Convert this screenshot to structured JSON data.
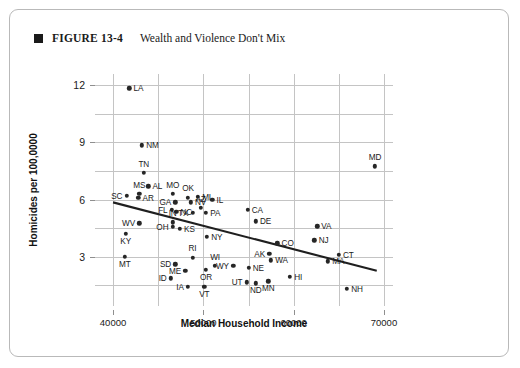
{
  "caption": {
    "marker": "square-bullet",
    "figure_number": "FIGURE 13-4",
    "title": "Wealth and Violence Don't Mix"
  },
  "chart_data": {
    "type": "scatter",
    "title": "Wealth and Violence Don't Mix",
    "xlabel": "Median Household Income",
    "ylabel": "Homicides per 100,0000",
    "xlim": [
      38000,
      71000
    ],
    "ylim": [
      0.4,
      12.6
    ],
    "xticks": [
      40000,
      50000,
      60000,
      70000
    ],
    "xticklabels": [
      "40000",
      "50000",
      "60000",
      "70000"
    ],
    "yticks": [
      3,
      6,
      9,
      12
    ],
    "yticklabels": [
      "3",
      "6",
      "9",
      "12"
    ],
    "grid": true,
    "legend": null,
    "trendline": {
      "type": "linear-fit",
      "x_start": 40000,
      "y_start": 5.85,
      "x_end": 69200,
      "y_end": 2.25
    },
    "point_label_field": "state",
    "points": [
      {
        "state": "LA",
        "x": 41800,
        "y": 11.85,
        "pos": "r"
      },
      {
        "state": "NM",
        "x": 43200,
        "y": 8.85,
        "pos": "r"
      },
      {
        "state": "MD",
        "x": 69000,
        "y": 7.75,
        "pos": "t"
      },
      {
        "state": "TN",
        "x": 43400,
        "y": 7.4,
        "pos": "t"
      },
      {
        "state": "AL",
        "x": 43900,
        "y": 6.7,
        "pos": "r"
      },
      {
        "state": "MS",
        "x": 42900,
        "y": 6.3,
        "pos": "t"
      },
      {
        "state": "SC",
        "x": 41500,
        "y": 6.2,
        "pos": "l"
      },
      {
        "state": "AR",
        "x": 42800,
        "y": 6.1,
        "pos": "r"
      },
      {
        "state": "MO",
        "x": 46600,
        "y": 6.3,
        "pos": "t"
      },
      {
        "state": "OK",
        "x": 48300,
        "y": 6.1,
        "pos": "t"
      },
      {
        "state": "MI",
        "x": 49400,
        "y": 6.15,
        "pos": "r"
      },
      {
        "state": "IL",
        "x": 51000,
        "y": 6.0,
        "pos": "r"
      },
      {
        "state": "GA",
        "x": 46900,
        "y": 5.85,
        "pos": "l"
      },
      {
        "state": "NV",
        "x": 48600,
        "y": 5.85,
        "pos": "r"
      },
      {
        "state": "AZ",
        "x": 49700,
        "y": 5.55,
        "pos": "t"
      },
      {
        "state": "CA",
        "x": 54900,
        "y": 5.45,
        "pos": "r"
      },
      {
        "state": "FL",
        "x": 46500,
        "y": 5.45,
        "pos": "l"
      },
      {
        "state": "NC",
        "x": 47000,
        "y": 5.35,
        "pos": "r"
      },
      {
        "state": "TX",
        "x": 48800,
        "y": 5.3,
        "pos": "l"
      },
      {
        "state": "PA",
        "x": 50300,
        "y": 5.3,
        "pos": "r"
      },
      {
        "state": "DE",
        "x": 55800,
        "y": 4.85,
        "pos": "r"
      },
      {
        "state": "IN",
        "x": 46600,
        "y": 4.8,
        "pos": "t"
      },
      {
        "state": "WV",
        "x": 42900,
        "y": 4.75,
        "pos": "l"
      },
      {
        "state": "OH",
        "x": 46600,
        "y": 4.55,
        "pos": "l"
      },
      {
        "state": "KS",
        "x": 47400,
        "y": 4.45,
        "pos": "r"
      },
      {
        "state": "VA",
        "x": 62600,
        "y": 4.6,
        "pos": "r"
      },
      {
        "state": "KY",
        "x": 41400,
        "y": 4.2,
        "pos": "b"
      },
      {
        "state": "NY",
        "x": 50400,
        "y": 4.05,
        "pos": "r"
      },
      {
        "state": "NJ",
        "x": 62300,
        "y": 3.85,
        "pos": "r"
      },
      {
        "state": "CO",
        "x": 58200,
        "y": 3.7,
        "pos": "r"
      },
      {
        "state": "CT",
        "x": 65000,
        "y": 3.1,
        "pos": "r"
      },
      {
        "state": "AK",
        "x": 57300,
        "y": 3.15,
        "pos": "l"
      },
      {
        "state": "MT",
        "x": 41300,
        "y": 3.0,
        "pos": "b"
      },
      {
        "state": "RI",
        "x": 48800,
        "y": 2.95,
        "pos": "t"
      },
      {
        "state": "WA",
        "x": 57500,
        "y": 2.8,
        "pos": "r"
      },
      {
        "state": "MA",
        "x": 63800,
        "y": 2.75,
        "pos": "r"
      },
      {
        "state": "SD",
        "x": 46900,
        "y": 2.6,
        "pos": "l"
      },
      {
        "state": "WI",
        "x": 51300,
        "y": 2.5,
        "pos": "t"
      },
      {
        "state": "WY",
        "x": 53300,
        "y": 2.5,
        "pos": "l"
      },
      {
        "state": "NE",
        "x": 55000,
        "y": 2.4,
        "pos": "r"
      },
      {
        "state": "ME",
        "x": 48000,
        "y": 2.25,
        "pos": "l"
      },
      {
        "state": "OR",
        "x": 50300,
        "y": 2.3,
        "pos": "b"
      },
      {
        "state": "HI",
        "x": 59600,
        "y": 1.95,
        "pos": "r"
      },
      {
        "state": "ID",
        "x": 46400,
        "y": 1.85,
        "pos": "l"
      },
      {
        "state": "UT",
        "x": 54800,
        "y": 1.65,
        "pos": "l"
      },
      {
        "state": "ND",
        "x": 55800,
        "y": 1.6,
        "pos": "b"
      },
      {
        "state": "MN",
        "x": 57200,
        "y": 1.7,
        "pos": "b"
      },
      {
        "state": "IA",
        "x": 48300,
        "y": 1.4,
        "pos": "l"
      },
      {
        "state": "VT",
        "x": 50100,
        "y": 1.4,
        "pos": "b"
      },
      {
        "state": "NH",
        "x": 65900,
        "y": 1.3,
        "pos": "r"
      }
    ]
  }
}
